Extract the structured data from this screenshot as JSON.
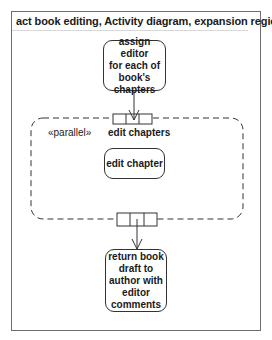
{
  "diagram": {
    "frame_title": "act book editing, Activity diagram, expansion region",
    "actions": {
      "assign": {
        "lines": [
          "assign editor",
          "for each of",
          "book's",
          "chapters"
        ]
      },
      "edit": {
        "lines": [
          "edit chapter"
        ]
      },
      "return": {
        "lines": [
          "return book",
          "draft to",
          "author with",
          "editor",
          "comments"
        ]
      }
    },
    "expansion_region": {
      "mode": "«parallel»",
      "name": "edit chapters",
      "border_style": "dashed"
    },
    "pins": {
      "input_pin": {
        "slots": 3
      },
      "output_pin": {
        "slots": 3
      }
    },
    "colors": {
      "line": "#333333",
      "frame": "#6e6e6e",
      "text": "#1a1a1a"
    }
  }
}
